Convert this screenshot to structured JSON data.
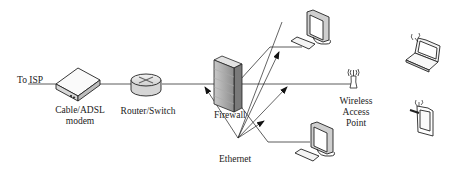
{
  "diagram": {
    "type": "network-topology",
    "nodes": [
      {
        "id": "isp",
        "label": "To ISP"
      },
      {
        "id": "modem",
        "label_lines": [
          "Cable/ADSL",
          "modem"
        ],
        "icon": "modem-icon"
      },
      {
        "id": "router",
        "label": "Router/Switch",
        "icon": "router-icon"
      },
      {
        "id": "firewall",
        "label": "Firewall",
        "icon": "firewall-icon"
      },
      {
        "id": "pc_top",
        "label": "",
        "icon": "desktop-computer-icon"
      },
      {
        "id": "pc_bottom",
        "label": "",
        "icon": "desktop-computer-icon"
      },
      {
        "id": "wap",
        "label_lines": [
          "Wireless",
          "Access",
          "Point"
        ],
        "icon": "wireless-antenna-icon"
      },
      {
        "id": "laptop",
        "label": "",
        "icon": "wireless-laptop-icon"
      },
      {
        "id": "phone",
        "label": "",
        "icon": "wireless-phone-icon"
      }
    ],
    "edges": [
      {
        "from": "isp",
        "to": "modem"
      },
      {
        "from": "modem",
        "to": "router"
      },
      {
        "from": "router",
        "to": "firewall"
      },
      {
        "from": "firewall",
        "to": "wap"
      },
      {
        "from": "firewall",
        "to": "pc_top"
      },
      {
        "from": "firewall",
        "to": "pc_bottom"
      }
    ],
    "annotation": {
      "label": "Ethernet",
      "points_to": [
        "router-firewall link",
        "firewall-pc_top link",
        "firewall-wap link",
        "firewall-pc_bottom link"
      ]
    }
  },
  "labels": {
    "isp": "To ISP",
    "modem_line1": "Cable/ADSL",
    "modem_line2": "modem",
    "router": "Router/Switch",
    "firewall": "Firewall",
    "ethernet": "Ethernet",
    "wap_line1": "Wireless",
    "wap_line2": "Access",
    "wap_line3": "Point"
  }
}
